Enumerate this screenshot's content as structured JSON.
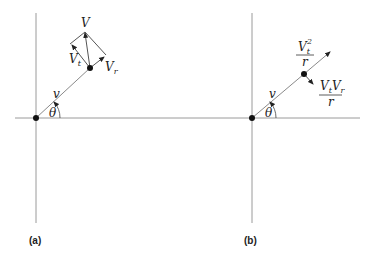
{
  "panels": [
    {
      "id": "a",
      "caption": "(a)",
      "labels": {
        "velocity": "V",
        "tangential": "V",
        "tangential_sub": "t",
        "radial": "V",
        "radial_sub": "r",
        "radius": "v",
        "angle": "θ"
      }
    },
    {
      "id": "b",
      "caption": "(b)",
      "labels": {
        "centripetal_num": "V",
        "centripetal_sub": "t",
        "centripetal_sup": "2",
        "centripetal_den": "r",
        "coriolis_num_a": "V",
        "coriolis_num_a_sub": "t",
        "coriolis_num_b": "V",
        "coriolis_num_b_sub": "r",
        "coriolis_den": "r",
        "radius": "v",
        "angle": "θ"
      }
    }
  ],
  "colors": {
    "axis": "#9a9a9a",
    "vector": "#555555",
    "point": "#111111",
    "text": "#222222"
  }
}
